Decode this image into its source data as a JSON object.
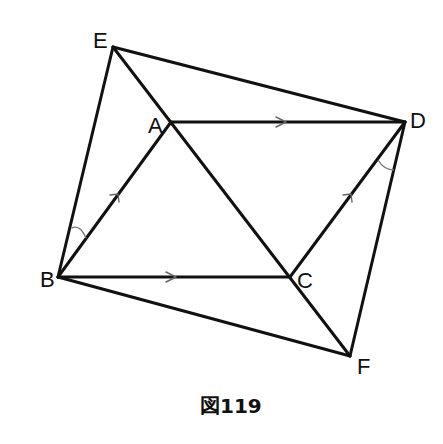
{
  "figure": {
    "caption": "図119",
    "stroke_color": "#111111",
    "mark_color": "#666666",
    "vertices": {
      "E": {
        "label": "E",
        "x": 113,
        "y": 47
      },
      "A": {
        "label": "A",
        "x": 171,
        "y": 122
      },
      "D": {
        "label": "D",
        "x": 405,
        "y": 122
      },
      "B": {
        "label": "B",
        "x": 58,
        "y": 277
      },
      "C": {
        "label": "C",
        "x": 290,
        "y": 277
      },
      "F": {
        "label": "F",
        "x": 350,
        "y": 356
      }
    },
    "segments": [
      "E-B",
      "E-D",
      "E-C",
      "A-B",
      "A-D",
      "B-C",
      "B-F",
      "C-D",
      "C-F",
      "D-F"
    ],
    "parallel_marks": [
      "A-D",
      "B-C",
      "B-A",
      "C-D"
    ],
    "angle_marks": [
      "angle EBA",
      "angle CDF"
    ]
  }
}
